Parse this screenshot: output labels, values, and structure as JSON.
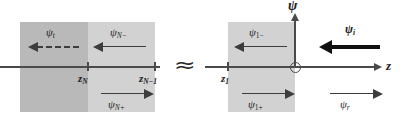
{
  "figure": {
    "type": "physics-schematic",
    "axes": {
      "horizontal_label": "z",
      "vertical_label": "ψ",
      "origin_marker": "open-circle"
    },
    "break_symbol": "≈",
    "colors": {
      "slab_dark": "#b9b9b9",
      "slab_light": "#d2d2d2",
      "axis": "#4a4a4a",
      "arrow": "#3d3d3d",
      "arrow_bold": "#111111",
      "background": "#ffffff"
    },
    "ticks": [
      {
        "name": "z_N",
        "base": "z",
        "sub": "N"
      },
      {
        "name": "z_N-1",
        "base": "z",
        "sub": "N−1"
      },
      {
        "name": "z_1",
        "base": "z",
        "sub": "1"
      }
    ],
    "waves": [
      {
        "id": "psi_t",
        "base": "ψ",
        "sub": "t",
        "sub_italic": true,
        "direction": "left",
        "style": "dashed",
        "region": "far-left-exterior"
      },
      {
        "id": "psi_N-",
        "base": "ψ",
        "sub": "N−",
        "sub_italic": true,
        "direction": "left",
        "style": "solid",
        "region": "layer-N"
      },
      {
        "id": "psi_N+",
        "base": "ψ",
        "sub": "N+",
        "sub_italic": true,
        "direction": "right",
        "style": "solid",
        "region": "layer-N"
      },
      {
        "id": "psi_1-",
        "base": "ψ",
        "sub": "1−",
        "sub_italic": false,
        "direction": "left",
        "style": "solid",
        "region": "layer-1"
      },
      {
        "id": "psi_1+",
        "base": "ψ",
        "sub": "1+",
        "sub_italic": false,
        "direction": "right",
        "style": "solid",
        "region": "layer-1"
      },
      {
        "id": "psi_i",
        "base": "ψ",
        "sub": "i",
        "sub_italic": true,
        "direction": "left",
        "style": "bold",
        "region": "right-exterior"
      },
      {
        "id": "psi_r",
        "base": "ψ",
        "sub": "r",
        "sub_italic": true,
        "direction": "right",
        "style": "solid",
        "region": "right-exterior"
      }
    ]
  }
}
